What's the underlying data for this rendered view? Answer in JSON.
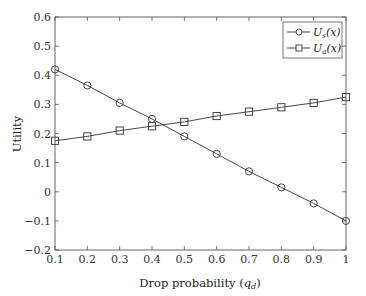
{
  "chart_data": {
    "type": "line",
    "title": "",
    "xlabel": "Drop probability (q_d)",
    "xlabel_main": "Drop probability (",
    "xlabel_var": "q",
    "xlabel_sub": "d",
    "xlabel_close": ")",
    "ylabel": "Utility",
    "xlim": [
      0.1,
      1
    ],
    "ylim": [
      -0.2,
      0.6
    ],
    "grid": false,
    "legend_position": "upper right",
    "x": [
      0.1,
      0.2,
      0.3,
      0.4,
      0.5,
      0.6,
      0.7,
      0.8,
      0.9,
      1.0
    ],
    "x_tick_labels": [
      "0.1",
      "0.2",
      "0.3",
      "0.4",
      "0.5",
      "0.6",
      "0.7",
      "0.8",
      "0.9",
      "1"
    ],
    "y_ticks": [
      0.6,
      0.5,
      0.4,
      0.3,
      0.2,
      0.1,
      0,
      -0.1,
      -0.2
    ],
    "y_tick_labels": [
      "0.6",
      "0.5",
      "0.4",
      "0.3",
      "0.2",
      "0.1",
      "0",
      "−0.1",
      "−0.2"
    ],
    "series": [
      {
        "name": "U_s(x)",
        "label_main": "U",
        "label_sub": "s",
        "label_arg": "(x)",
        "marker": "circle",
        "values": [
          0.42,
          0.365,
          0.305,
          0.25,
          0.19,
          0.13,
          0.07,
          0.015,
          -0.04,
          -0.1
        ]
      },
      {
        "name": "U_a(x)",
        "label_main": "U",
        "label_sub": "a",
        "label_arg": "(x)",
        "marker": "square",
        "values": [
          0.175,
          0.19,
          0.21,
          0.225,
          0.24,
          0.26,
          0.275,
          0.29,
          0.305,
          0.325
        ]
      }
    ]
  },
  "colors": {
    "line": "#333333",
    "axis": "#555555",
    "background": "#ffffff"
  }
}
